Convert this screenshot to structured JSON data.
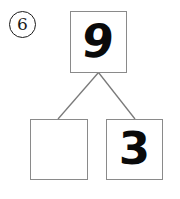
{
  "worksheet": {
    "problem_number": "6",
    "type": "number-bond",
    "whole_box": {
      "value": "9",
      "filled": true
    },
    "part_boxes": [
      {
        "position": "left",
        "value": "",
        "filled": false
      },
      {
        "position": "right",
        "value": "3",
        "filled": true
      }
    ],
    "colors": {
      "ink": "#0a0a0a",
      "box_border": "#8a8a8a",
      "connector": "#7a7a7a",
      "background": "#ffffff"
    }
  }
}
